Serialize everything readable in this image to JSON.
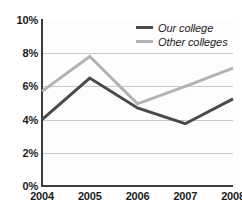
{
  "chart_data": {
    "type": "line",
    "title": "",
    "xlabel": "",
    "ylabel": "",
    "categories": [
      "2004",
      "2005",
      "2006",
      "2007",
      "2008"
    ],
    "x_tick_labels": [
      "2004",
      "2005",
      "2006",
      "2007",
      "2008"
    ],
    "y_tick_labels": [
      "0%",
      "2%",
      "4%",
      "6%",
      "8%",
      "10%"
    ],
    "y_tick_values": [
      0,
      2,
      4,
      6,
      8,
      10
    ],
    "ylim": [
      0,
      10
    ],
    "grid": true,
    "legend_position": "top-right",
    "series": [
      {
        "name": "Our college",
        "color": "#4a4a4a",
        "values": [
          4.0,
          6.5,
          4.7,
          3.75,
          5.25
        ]
      },
      {
        "name": "Other colleges",
        "color": "#b3b3b3",
        "values": [
          5.7,
          7.8,
          4.95,
          6.0,
          7.1
        ]
      }
    ]
  },
  "legend": {
    "items": [
      {
        "label": "Our college",
        "color": "#4a4a4a"
      },
      {
        "label": "Other colleges",
        "color": "#b3b3b3"
      }
    ]
  },
  "colors": {
    "our_college": "#4a4a4a",
    "other_colleges": "#b3b3b3",
    "axis": "#3a3a3a",
    "gridline": "#c9c9c9",
    "text": "#1c1c1c",
    "plot_background": "#fdfdfd",
    "page_background": "#ffffff"
  }
}
